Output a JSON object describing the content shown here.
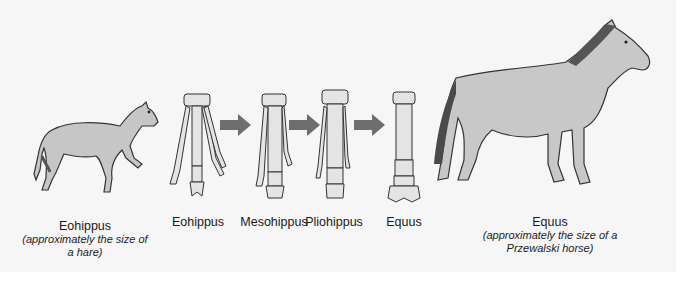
{
  "diagram": {
    "colors": {
      "background": "#f6f6f6",
      "body_fill": "#c8c8c8",
      "outline": "#333333",
      "arrow": "#6e6e6e",
      "bone": "#e4e4e4"
    },
    "stages": [
      {
        "id": "eohippus-animal",
        "name": "Eohippus",
        "note": "(approximately the size of a hare)"
      },
      {
        "id": "eohippus-foot",
        "name": "Eohippus"
      },
      {
        "id": "mesohippus-foot",
        "name": "Mesohippus"
      },
      {
        "id": "pliohippus-foot",
        "name": "Pliohippus"
      },
      {
        "id": "equus-foot",
        "name": "Equus"
      },
      {
        "id": "equus-animal",
        "name": "Equus",
        "note": "(approximately the size of a Przewalski horse)"
      }
    ],
    "arrows": [
      {
        "from": "Eohippus",
        "to": "Mesohippus",
        "icon": "arrow-right-icon"
      },
      {
        "from": "Mesohippus",
        "to": "Pliohippus",
        "icon": "arrow-right-icon"
      },
      {
        "from": "Pliohippus",
        "to": "Equus",
        "icon": "arrow-right-icon"
      }
    ]
  }
}
